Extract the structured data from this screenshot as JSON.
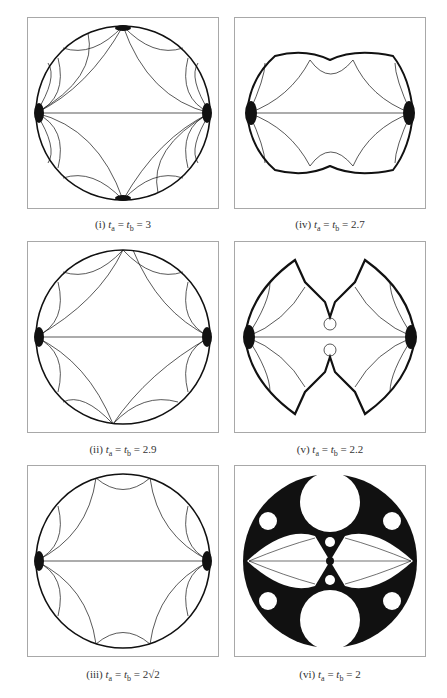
{
  "figure": {
    "panels": [
      {
        "id": "i",
        "label": "(i)",
        "eq": "t_a = t_b = 3",
        "value": "3",
        "shape": "disk"
      },
      {
        "id": "ii",
        "label": "(ii)",
        "eq": "t_a = t_b = 2.9",
        "value": "2.9",
        "shape": "disk"
      },
      {
        "id": "iii",
        "label": "(iii)",
        "eq": "t_a = t_b = 2√2",
        "value": "2√2",
        "shape": "disk"
      },
      {
        "id": "iv",
        "label": "(iv)",
        "eq": "t_a = t_b = 2.7",
        "value": "2.7",
        "shape": "quasi-rect"
      },
      {
        "id": "v",
        "label": "(v)",
        "eq": "t_a = t_b = 2.2",
        "value": "2.2",
        "shape": "fractal-bat"
      },
      {
        "id": "vi",
        "label": "(vi)",
        "eq": "t_a = t_b = 2",
        "value": "2",
        "shape": "apollonian"
      }
    ],
    "caption_prefix_var": "t",
    "sub_a": "a",
    "sub_b": "b",
    "equals": "=",
    "colors": {
      "ink": "#111111",
      "frame": "#a8a8a8",
      "background": "#ffffff"
    }
  }
}
